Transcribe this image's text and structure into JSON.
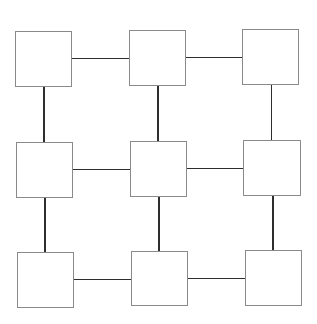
{
  "diagram": {
    "type": "grid-graph",
    "rows": 3,
    "cols": 3,
    "colors": {
      "node_border": "#8a8a8a",
      "edge": "#2e2e2e",
      "background": "#ffffff"
    },
    "nodes": [
      {
        "id": "r1c1",
        "x": 15,
        "y": 31,
        "w": 57,
        "h": 56
      },
      {
        "id": "r1c2",
        "x": 129,
        "y": 30,
        "w": 57,
        "h": 56
      },
      {
        "id": "r1c3",
        "x": 242,
        "y": 29,
        "w": 57,
        "h": 56
      },
      {
        "id": "r2c1",
        "x": 16,
        "y": 142,
        "w": 57,
        "h": 56
      },
      {
        "id": "r2c2",
        "x": 130,
        "y": 141,
        "w": 57,
        "h": 56
      },
      {
        "id": "r2c3",
        "x": 243,
        "y": 140,
        "w": 58,
        "h": 56
      },
      {
        "id": "r3c1",
        "x": 17,
        "y": 252,
        "w": 57,
        "h": 56
      },
      {
        "id": "r3c2",
        "x": 131,
        "y": 251,
        "w": 57,
        "h": 55
      },
      {
        "id": "r3c3",
        "x": 245,
        "y": 250,
        "w": 57,
        "h": 56
      }
    ],
    "edges": [
      {
        "from": "r1c1",
        "to": "r1c2"
      },
      {
        "from": "r1c2",
        "to": "r1c3"
      },
      {
        "from": "r2c1",
        "to": "r2c2"
      },
      {
        "from": "r2c2",
        "to": "r2c3"
      },
      {
        "from": "r3c1",
        "to": "r3c2"
      },
      {
        "from": "r3c2",
        "to": "r3c3"
      },
      {
        "from": "r1c1",
        "to": "r2c1"
      },
      {
        "from": "r2c1",
        "to": "r3c1"
      },
      {
        "from": "r1c2",
        "to": "r2c2"
      },
      {
        "from": "r2c2",
        "to": "r3c2"
      },
      {
        "from": "r1c3",
        "to": "r2c3"
      },
      {
        "from": "r2c3",
        "to": "r3c3"
      }
    ]
  }
}
